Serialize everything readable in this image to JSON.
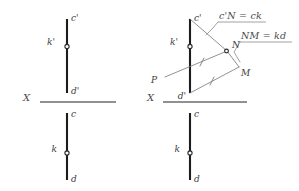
{
  "figure": {
    "background_color": "#ffffff",
    "line_color": "#1c1c1c",
    "thin_line_color": "#7d7d7d",
    "axis_color": "#6d6d6d",
    "views": [
      {
        "name": "left-view",
        "description": "Two-view projection of segment c-d with point k",
        "axis_label": "X",
        "labels": [
          "c'",
          "k'",
          "d'",
          "c",
          "k",
          "d"
        ]
      },
      {
        "name": "right-view",
        "description": "Same projection with rabatment triangle and auxiliary construction",
        "axis_label": "X",
        "labels": [
          "c'",
          "k'",
          "d'",
          "P",
          "N",
          "M",
          "c",
          "k",
          "d"
        ]
      }
    ]
  },
  "left_diagram": {
    "axis_label": "X",
    "frontal_view": {
      "top_label": "c'",
      "point_label": "k'",
      "bottom_label": "d'"
    },
    "horizontal_view": {
      "top_label": "c",
      "point_label": "k",
      "bottom_label": "d"
    }
  },
  "right_diagram": {
    "axis_label": "X",
    "frontal_view": {
      "top_label": "c'",
      "point_label": "k'",
      "bottom_label": "d'"
    },
    "horizontal_view": {
      "top_label": "c",
      "point_label": "k",
      "bottom_label": "d"
    },
    "construction_points": {
      "p_label": "P",
      "n_label": "N",
      "m_label": "M"
    },
    "annotations": [
      {
        "id": "annotation-cn",
        "text": "c'N = ck"
      },
      {
        "id": "annotation-nm",
        "text": "NM = kd"
      }
    ]
  }
}
